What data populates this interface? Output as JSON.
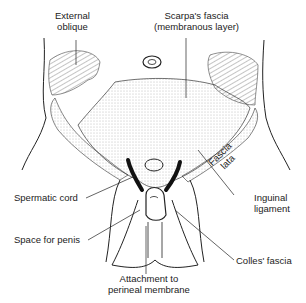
{
  "diagram": {
    "labels": {
      "external_oblique_1": "External",
      "external_oblique_2": "oblique",
      "scarpa_1": "Scarpa's fascia",
      "scarpa_2": "(membranous layer)",
      "spermatic_cord": "Spermatic cord",
      "space_for_penis": "Space for penis",
      "attachment_1": "Attachment to",
      "attachment_2": "perineal membrane",
      "fascia_lata_1": "Fascia",
      "fascia_lata_2": "lata",
      "inguinal_1": "Inguinal",
      "inguinal_2": "ligament",
      "colles": "Colles' fascia"
    },
    "colors": {
      "ink": "#222222",
      "stipple": "#9a9a9a",
      "background": "#ffffff"
    }
  }
}
